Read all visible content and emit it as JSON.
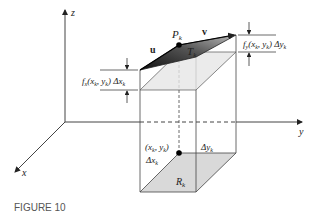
{
  "figure": {
    "caption": "FIGURE 10",
    "axes": {
      "x": "x",
      "y": "y",
      "z": "z"
    },
    "labels": {
      "point_top": "P",
      "point_top_sub": "k",
      "plane": "T",
      "plane_sub": "k",
      "vector_u": "u",
      "vector_v": "v",
      "region": "R",
      "region_sub": "k",
      "base_point": "(x",
      "base_point_sub1": "k",
      "base_point_mid": ", y",
      "base_point_sub2": "k",
      "base_point_end": ")",
      "delta_x": "Δx",
      "delta_x_sub": "k",
      "delta_y": "Δy",
      "delta_y_sub": "k",
      "fx_term": "f",
      "fx_term_sub": "x",
      "fx_term_args": "(x",
      "fx_args_sub1": "k",
      "fx_args_mid": ", y",
      "fx_args_sub2": "k",
      "fx_args_end": ") Δx",
      "fx_args_sub3": "k",
      "fy_term": "f",
      "fy_term_sub": "y",
      "fy_term_args": "(x",
      "fy_args_sub1": "k",
      "fy_args_mid": ", y",
      "fy_args_sub2": "k",
      "fy_args_end": ") Δy",
      "fy_args_sub3": "k"
    },
    "colors": {
      "line": "#333333",
      "region_fill": "#d9d9d9",
      "plane_dark": "#2b2b2b",
      "plane_light": "#9a9a9a"
    }
  }
}
